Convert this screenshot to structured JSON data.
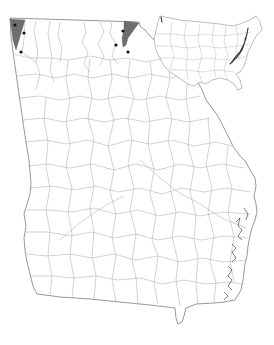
{
  "map": {
    "main_region": "Georgia",
    "inset_region": "United States",
    "colors": {
      "background": "#ffffff",
      "county_lines": "#9a9a9a",
      "state_outline": "#6b6b6b",
      "shaded_counties": "#6e6e6e",
      "occurrence_dots": "#111111",
      "range_highlight": "#333333"
    },
    "shaded_regions": [
      {
        "name": "northwest-corner",
        "points": "10,19 25,20 22,30 16,50 13,40"
      },
      {
        "name": "northeast-corner",
        "points": "124,21 139,23 133,31 128,38 126,45 123,47 122,38 124,30"
      }
    ],
    "occurrence_points": [
      {
        "x": 15,
        "y": 25
      },
      {
        "x": 24,
        "y": 33
      },
      {
        "x": 21,
        "y": 52
      },
      {
        "x": 123,
        "y": 31
      },
      {
        "x": 116,
        "y": 45
      },
      {
        "x": 128,
        "y": 52
      }
    ],
    "legend": null
  }
}
